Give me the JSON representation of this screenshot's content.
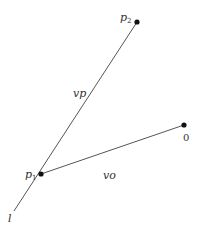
{
  "diagram": {
    "points": {
      "p1": {
        "label": "p",
        "sub": "1",
        "x": 41,
        "y": 174
      },
      "p2": {
        "label": "p",
        "sub": "2",
        "x": 137,
        "y": 22
      },
      "o": {
        "label": "0",
        "x": 184,
        "y": 125
      }
    },
    "lines": {
      "l": {
        "label": "l"
      },
      "vp": {
        "label": "vp"
      },
      "vo": {
        "label": "vo"
      }
    },
    "colors": {
      "stroke": "#555555",
      "dot": "#111111",
      "text": "#333333"
    }
  }
}
